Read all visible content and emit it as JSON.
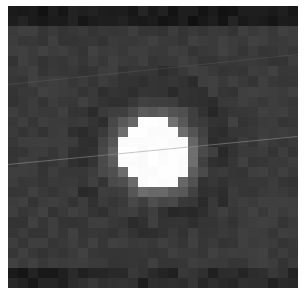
{
  "image": {
    "subject": "astronomical cutout of a bright point source with halo",
    "grid_cols": 29,
    "grid_rows": 28,
    "background_color": "#3a3a3a",
    "core": {
      "cx_pct": 50.5,
      "cy_pct": 52.5,
      "color": "#ffffff"
    },
    "streaks": [
      {
        "x1": 0,
        "y1": 158,
        "x2": 290,
        "y2": 130,
        "color": "rgba(150,150,150,0.55)"
      },
      {
        "x1": 0,
        "y1": 78,
        "x2": 290,
        "y2": 48,
        "color": "rgba(120,120,120,0.25)"
      }
    ]
  }
}
